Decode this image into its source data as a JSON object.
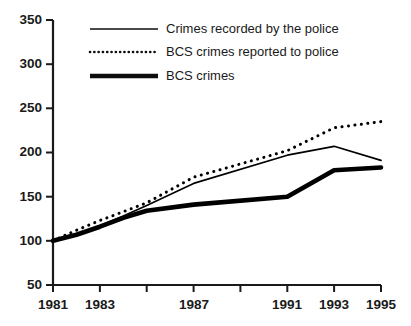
{
  "chart_data": {
    "type": "line",
    "title": "",
    "subtitle": "",
    "xlabel": "",
    "ylabel": "",
    "x": [
      1981,
      1983,
      1985,
      1987,
      1989,
      1991,
      1993,
      1995
    ],
    "xtick_labels": [
      "1981",
      "1983",
      "",
      "1987",
      "",
      "1991",
      "1993",
      "1995"
    ],
    "xtick_labels_visible": [
      "1981",
      "1983",
      "1987",
      "1991",
      "1993",
      "1995"
    ],
    "ytick_labels": [
      "50",
      "100",
      "150",
      "200",
      "250",
      "300",
      "350"
    ],
    "yticks": [
      50,
      100,
      150,
      200,
      250,
      300,
      350
    ],
    "ylim": [
      50,
      350
    ],
    "xlim": [
      1981,
      1995
    ],
    "grid": false,
    "legend_position": "top-center",
    "series": [
      {
        "name": "Crimes recorded by the police",
        "style": "solid-thin",
        "color": "#000000",
        "values": [
          100,
          107,
          117,
          128,
          140,
          165,
          197,
          207,
          191
        ],
        "x": [
          1981,
          1982,
          1983,
          1984,
          1985,
          1987,
          1991,
          1993,
          1995
        ]
      },
      {
        "name": "BCS crimes reported to police",
        "style": "dotted",
        "color": "#000000",
        "values": [
          100,
          112,
          123,
          133,
          143,
          172,
          202,
          228,
          235
        ],
        "x": [
          1981,
          1982,
          1983,
          1984,
          1985,
          1987,
          1991,
          1993,
          1995
        ]
      },
      {
        "name": "BCS crimes",
        "style": "solid-thick",
        "color": "#000000",
        "values": [
          100,
          107,
          116,
          126,
          134,
          141,
          150,
          180,
          183
        ],
        "x": [
          1981,
          1982,
          1983,
          1984,
          1985,
          1987,
          1991,
          1993,
          1995
        ]
      }
    ]
  },
  "axes": {
    "y_ticks": [
      {
        "label": "350",
        "value": 350
      },
      {
        "label": "300",
        "value": 300
      },
      {
        "label": "250",
        "value": 250
      },
      {
        "label": "200",
        "value": 200
      },
      {
        "label": "150",
        "value": 150
      },
      {
        "label": "100",
        "value": 100
      },
      {
        "label": "50",
        "value": 50
      }
    ],
    "x_ticks": [
      {
        "label": "1981",
        "value": 1981
      },
      {
        "label": "1983",
        "value": 1983
      },
      {
        "label": "",
        "value": 1985
      },
      {
        "label": "1987",
        "value": 1987
      },
      {
        "label": "",
        "value": 1989
      },
      {
        "label": "1991",
        "value": 1991
      },
      {
        "label": "1993",
        "value": 1993
      },
      {
        "label": "1995",
        "value": 1995
      }
    ]
  },
  "legend": {
    "items": [
      {
        "label": "Crimes recorded by the police",
        "style": "solid-thin"
      },
      {
        "label": "BCS crimes reported to police",
        "style": "dotted"
      },
      {
        "label": "BCS crimes",
        "style": "solid-thick"
      }
    ]
  }
}
